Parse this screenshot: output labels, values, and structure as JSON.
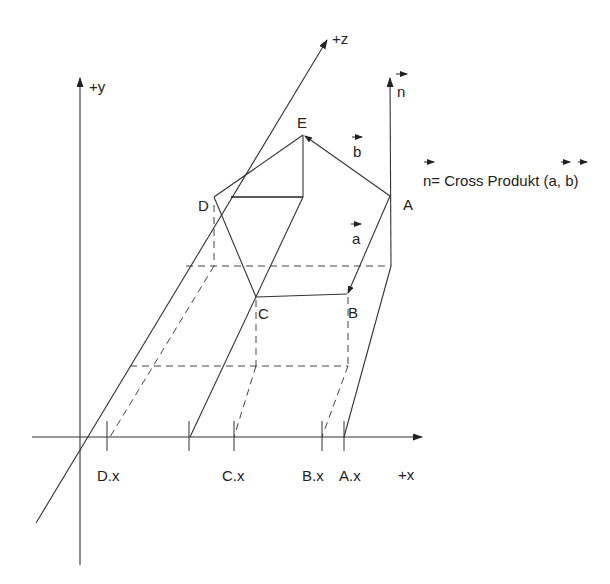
{
  "diagram": {
    "type": "3d-coordinate-diagram",
    "axes": {
      "x_label": "+x",
      "y_label": "+y",
      "z_label": "+z"
    },
    "points": [
      {
        "name": "A",
        "label": "A"
      },
      {
        "name": "B",
        "label": "B"
      },
      {
        "name": "C",
        "label": "C"
      },
      {
        "name": "D",
        "label": "D"
      },
      {
        "name": "E",
        "label": "E"
      }
    ],
    "x_ticks": [
      "D.x",
      "C.x",
      "B.x",
      "A.x"
    ],
    "vectors": {
      "a": "a",
      "b": "b",
      "n": "n"
    },
    "formula": {
      "lhs": "n",
      "text": "= Cross Produkt (",
      "arg1": "a",
      "sep": ", ",
      "arg2": "b",
      "close": ")"
    },
    "colors": {
      "line": "#333333",
      "background": "#ffffff"
    }
  }
}
